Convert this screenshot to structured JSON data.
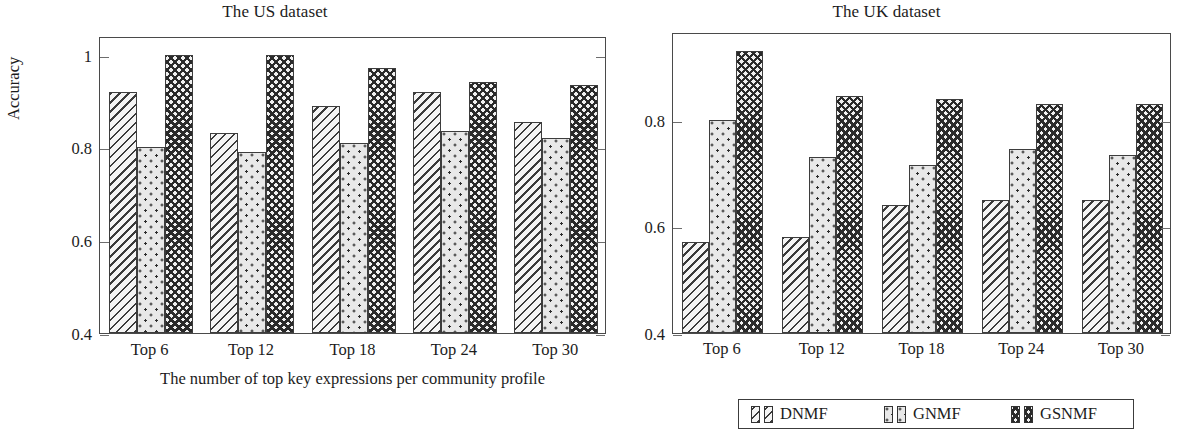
{
  "figure": {
    "ylabel": "Accuracy",
    "xlabel": "The number of top key expressions per community profile"
  },
  "legend": {
    "entries": [
      {
        "label": "DNMF",
        "pattern": "diagonal-hatch"
      },
      {
        "label": "GNMF",
        "pattern": "dot-grid"
      },
      {
        "label": "GSNMF",
        "pattern": "cross-hatch"
      }
    ]
  },
  "chart_data": [
    {
      "type": "bar",
      "title": "The US dataset",
      "xlabel": "The number of top key expressions per community profile",
      "ylabel": "Accuracy",
      "categories": [
        "Top 6",
        "Top 12",
        "Top 18",
        "Top 24",
        "Top 30"
      ],
      "ylim": [
        0.4,
        1.04
      ],
      "yticks": [
        0.4,
        0.6,
        0.8,
        1.0
      ],
      "ytick_labels": [
        "0.4",
        "0.6",
        "0.8",
        "1"
      ],
      "grid": false,
      "legend_position": "bottom-right-shared",
      "series": [
        {
          "name": "DNMF",
          "values": [
            0.92,
            0.83,
            0.89,
            0.92,
            0.855
          ]
        },
        {
          "name": "GNMF",
          "values": [
            0.8,
            0.79,
            0.81,
            0.835,
            0.82
          ]
        },
        {
          "name": "GSNMF",
          "values": [
            1.0,
            1.0,
            0.97,
            0.94,
            0.935
          ]
        }
      ]
    },
    {
      "type": "bar",
      "title": "The UK dataset",
      "xlabel": "",
      "ylabel": "",
      "categories": [
        "Top 6",
        "Top 12",
        "Top 18",
        "Top 24",
        "Top 30"
      ],
      "ylim": [
        0.4,
        0.965
      ],
      "yticks": [
        0.4,
        0.6,
        0.8
      ],
      "ytick_labels": [
        "0.4",
        "0.6",
        "0.8"
      ],
      "grid": false,
      "legend_position": "below",
      "series": [
        {
          "name": "DNMF",
          "values": [
            0.57,
            0.58,
            0.64,
            0.65,
            0.65
          ]
        },
        {
          "name": "GNMF",
          "values": [
            0.8,
            0.73,
            0.715,
            0.745,
            0.735
          ]
        },
        {
          "name": "GSNMF",
          "values": [
            0.93,
            0.845,
            0.84,
            0.83,
            0.83
          ]
        }
      ]
    }
  ]
}
